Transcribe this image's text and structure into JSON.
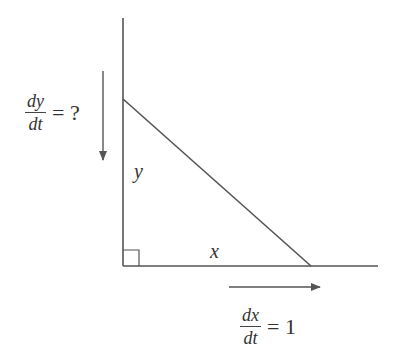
{
  "diagram": {
    "labels": {
      "vertical_leg": "y",
      "horizontal_leg": "x"
    },
    "rate_y": {
      "numerator": "dy",
      "denominator": "dt",
      "equals": "= ?"
    },
    "rate_x": {
      "numerator": "dx",
      "denominator": "dt",
      "equals": "= 1"
    },
    "colors": {
      "line": "#555555",
      "text": "#333333",
      "background": "#ffffff"
    }
  }
}
